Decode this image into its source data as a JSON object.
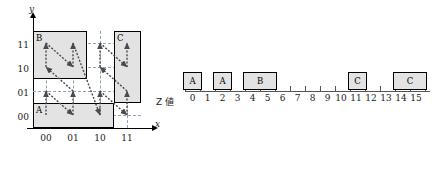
{
  "grid": {
    "axis": {
      "x_label": "x",
      "y_label": "y"
    },
    "x_ticks": [
      "00",
      "01",
      "10",
      "11"
    ],
    "y_ticks": [
      "11",
      "10",
      "01",
      "00"
    ],
    "regions": [
      {
        "label": "A",
        "col_start": 0,
        "col_span": 2,
        "row_start": 3,
        "row_span": 1
      },
      {
        "label": "B",
        "col_start": 0,
        "col_span": 1,
        "row_start": 0,
        "row_span": 2
      },
      {
        "label": "C",
        "col_start": 3,
        "col_span": 1,
        "row_start": 0,
        "row_span": 3
      }
    ],
    "curve_name": "z-order-curve"
  },
  "strip": {
    "caption": "Z 値",
    "numbers": [
      "0",
      "1",
      "2",
      "3",
      "4",
      "5",
      "6",
      "7",
      "8",
      "9",
      "10",
      "11",
      "12",
      "13",
      "14",
      "15"
    ],
    "boxes": [
      {
        "label": "A",
        "start": 0,
        "end": 0
      },
      {
        "label": "A",
        "start": 2,
        "end": 2
      },
      {
        "label": "B",
        "start": 4,
        "end": 5
      },
      {
        "label": "C",
        "start": 11,
        "end": 11
      },
      {
        "label": "C",
        "start": 14,
        "end": 15
      }
    ]
  },
  "colors": {
    "region_fill": "#e3e3e3",
    "region_border": "#000000",
    "gridline": "#8fa3bf",
    "curve": "#4a4a4a",
    "axis": "#000000"
  }
}
